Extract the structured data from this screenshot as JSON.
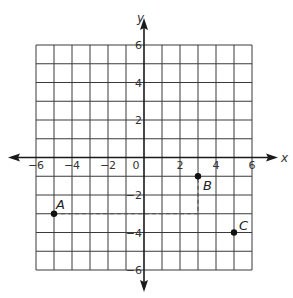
{
  "chart_data": {
    "type": "scatter",
    "title": "",
    "xlabel": "x",
    "ylabel": "y",
    "xlim": [
      -6,
      6
    ],
    "ylim": [
      -6,
      6
    ],
    "grid": true,
    "grid_step": 1,
    "x_ticks": [
      -6,
      -4,
      -2,
      0,
      2,
      4,
      6
    ],
    "y_ticks": [
      6,
      4,
      2,
      -2,
      -4,
      -6
    ],
    "points": [
      {
        "label": "A",
        "x": -5,
        "y": -3
      },
      {
        "label": "B",
        "x": 3,
        "y": -1
      },
      {
        "label": "C",
        "x": 5,
        "y": -4
      }
    ],
    "dashed_path": [
      {
        "x": -5,
        "y": -3
      },
      {
        "x": 3,
        "y": -3
      },
      {
        "x": 3,
        "y": -1
      }
    ],
    "colors": {
      "grid": "#3a3a3a",
      "axis": "#1a1a1a",
      "point": "#111111"
    }
  }
}
